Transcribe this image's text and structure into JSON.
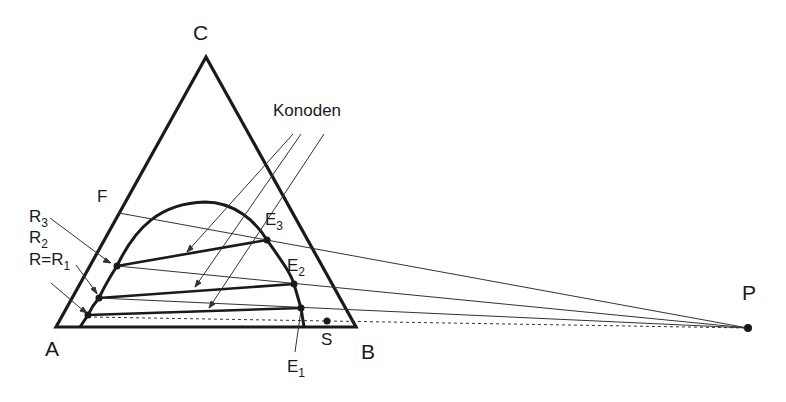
{
  "diagram": {
    "type": "ternary-phase-diagram",
    "vertices": {
      "A": "A",
      "B": "B",
      "C": "C"
    },
    "labels": {
      "F": "F",
      "S": "S",
      "P": "P",
      "konoden": "Konoden",
      "R3": "R",
      "R3_sub": "3",
      "R2": "R",
      "R2_sub": "2",
      "R1_prefix": "R=R",
      "R1_sub": "1",
      "E3": "E",
      "E3_sub": "3",
      "E2": "E",
      "E2_sub": "2",
      "E1": "E",
      "E1_sub": "1"
    },
    "colors": {
      "line": "#1a1a1a",
      "background": "#ffffff"
    }
  }
}
